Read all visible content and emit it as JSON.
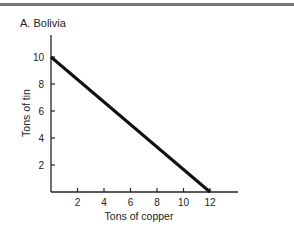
{
  "chart_data": {
    "type": "line",
    "title": "A. Bolivia",
    "xlabel": "Tons of copper",
    "ylabel": "Tons of tin",
    "x_ticks": [
      "2",
      "4",
      "6",
      "8",
      "10",
      "12"
    ],
    "y_ticks": [
      "2",
      "4",
      "6",
      "8",
      "10"
    ],
    "xlim": [
      0,
      14
    ],
    "ylim": [
      0,
      11.5
    ],
    "grid": false,
    "series": [
      {
        "name": "Bolivia PPF",
        "x": [
          0,
          12
        ],
        "y": [
          10,
          0
        ]
      }
    ]
  },
  "colors": {
    "line": "#111111",
    "topbar": "#777777"
  }
}
